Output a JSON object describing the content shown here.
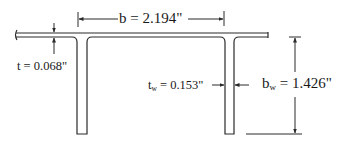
{
  "figure": {
    "type": "T-section cross-section dimension diagram",
    "colors": {
      "line": "#2a2a2a",
      "background": "#ffffff"
    }
  },
  "dimensions": {
    "flange_width": {
      "symbol": "b",
      "value": "2.194\"",
      "label": "b = 2.194\""
    },
    "flange_thickness": {
      "symbol": "t",
      "value": "0.068\"",
      "label": "t = 0.068\""
    },
    "web_thickness": {
      "symbol": "t",
      "subscript": "w",
      "equals": "=",
      "value": "0.153\""
    },
    "web_depth": {
      "symbol": "b",
      "subscript": "w",
      "equals": "=",
      "value": "1.426\""
    }
  }
}
